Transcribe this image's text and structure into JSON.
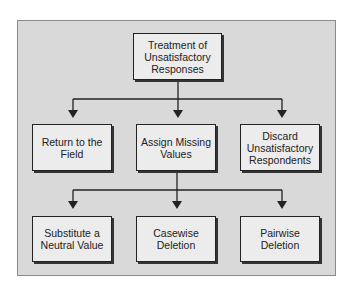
{
  "diagram": {
    "root": {
      "label": "Treatment of\nUnsatisfactory\nResponses"
    },
    "level1": [
      {
        "label": "Return to the\nField"
      },
      {
        "label": "Assign Missing\nValues"
      },
      {
        "label": "Discard\nUnsatisfactory\nRespondents"
      }
    ],
    "level2": [
      {
        "label": "Substitute a\nNeutral Value"
      },
      {
        "label": "Casewise\nDeletion"
      },
      {
        "label": "Pairwise\nDeletion"
      }
    ],
    "edges": [
      [
        "Treatment of Unsatisfactory Responses",
        "Return to the Field"
      ],
      [
        "Treatment of Unsatisfactory Responses",
        "Assign Missing Values"
      ],
      [
        "Treatment of Unsatisfactory Responses",
        "Discard Unsatisfactory Respondents"
      ],
      [
        "Assign Missing Values",
        "Substitute a Neutral Value"
      ],
      [
        "Assign Missing Values",
        "Casewise Deletion"
      ],
      [
        "Assign Missing Values",
        "Pairwise Deletion"
      ]
    ],
    "colors": {
      "panel": "#d9d9d9",
      "box": "#ececec",
      "line": "#222222"
    }
  }
}
